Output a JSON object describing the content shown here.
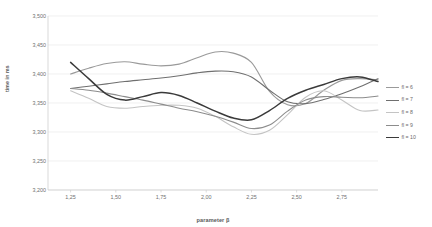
{
  "chart_data": {
    "type": "line",
    "title": "",
    "xlabel": "parameter β",
    "ylabel": "time in ms",
    "xlim": [
      1.125,
      2.95
    ],
    "ylim": [
      3200,
      3500
    ],
    "grid": true,
    "legend_position": "right",
    "ytick_labels": [
      "3,500",
      "3,450",
      "3,400",
      "3,350",
      "3,300",
      "3,250",
      "3,200"
    ],
    "ytick_values": [
      3500,
      3450,
      3400,
      3350,
      3300,
      3250,
      3200
    ],
    "xtick_labels": [
      "1,25",
      "1,50",
      "1,75",
      "2,00",
      "2,25",
      "2,50",
      "2,75"
    ],
    "xtick_values": [
      1.25,
      1.5,
      1.75,
      2.0,
      2.25,
      2.5,
      2.75
    ],
    "x": [
      1.25,
      1.35,
      1.45,
      1.55,
      1.65,
      1.75,
      1.85,
      1.95,
      2.05,
      2.15,
      2.25,
      2.35,
      2.45,
      2.55,
      2.65,
      2.75,
      2.85,
      2.95
    ],
    "series": [
      {
        "name": "fl = 6",
        "color": "#9a9a9a",
        "width": 1.1,
        "values": [
          3400,
          3410,
          3418,
          3421,
          3417,
          3414,
          3417,
          3428,
          3438,
          3436,
          3420,
          3370,
          3347,
          3349,
          3372,
          3389,
          3392,
          3390
        ]
      },
      {
        "name": "fl = 7",
        "color": "#6f6f6f",
        "width": 1.1,
        "values": [
          3375,
          3379,
          3383,
          3387,
          3390,
          3393,
          3397,
          3402,
          3405,
          3404,
          3395,
          3372,
          3352,
          3349,
          3356,
          3366,
          3378,
          3392
        ]
      },
      {
        "name": "fl = 8",
        "color": "#c4c4c4",
        "width": 1.1,
        "values": [
          3371,
          3358,
          3344,
          3341,
          3344,
          3346,
          3346,
          3341,
          3327,
          3309,
          3296,
          3303,
          3330,
          3360,
          3371,
          3355,
          3337,
          3338
        ]
      },
      {
        "name": "fl = 9",
        "color": "#8c8c8c",
        "width": 1.1,
        "values": [
          3375,
          3372,
          3367,
          3361,
          3355,
          3348,
          3341,
          3335,
          3327,
          3317,
          3306,
          3312,
          3336,
          3355,
          3361,
          3360,
          3359,
          3362
        ]
      },
      {
        "name": "fl = 10",
        "color": "#3a3a3a",
        "width": 1.5,
        "values": [
          3420,
          3392,
          3365,
          3355,
          3361,
          3368,
          3363,
          3350,
          3336,
          3324,
          3321,
          3337,
          3358,
          3372,
          3382,
          3392,
          3395,
          3387
        ]
      }
    ]
  },
  "legend": {
    "items": [
      {
        "label": "fl = 6"
      },
      {
        "label": "fl = 7"
      },
      {
        "label": "fl = 8"
      },
      {
        "label": "fl = 9"
      },
      {
        "label": "fl = 10"
      }
    ]
  },
  "axes": {
    "x_title": "parameter β",
    "y_title": "time in ms"
  }
}
